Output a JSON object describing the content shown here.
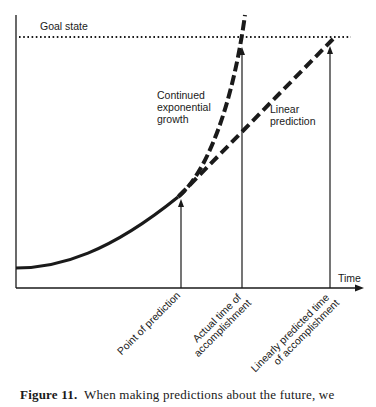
{
  "figure": {
    "goal_label": "Goal state",
    "time_label": "Time",
    "exp_label_lines": [
      "Continued",
      "exponential",
      "growth"
    ],
    "lin_label_lines": [
      "Linear",
      "prediction"
    ],
    "xlabels": {
      "point": [
        "Point of prediction"
      ],
      "actual": [
        "Actual time of",
        "accomplishment"
      ],
      "linear": [
        "Linearly predicted time",
        "of accomplishment"
      ]
    }
  },
  "caption": {
    "number": "Figure 11.",
    "text": "When making predictions about the future, we"
  }
}
